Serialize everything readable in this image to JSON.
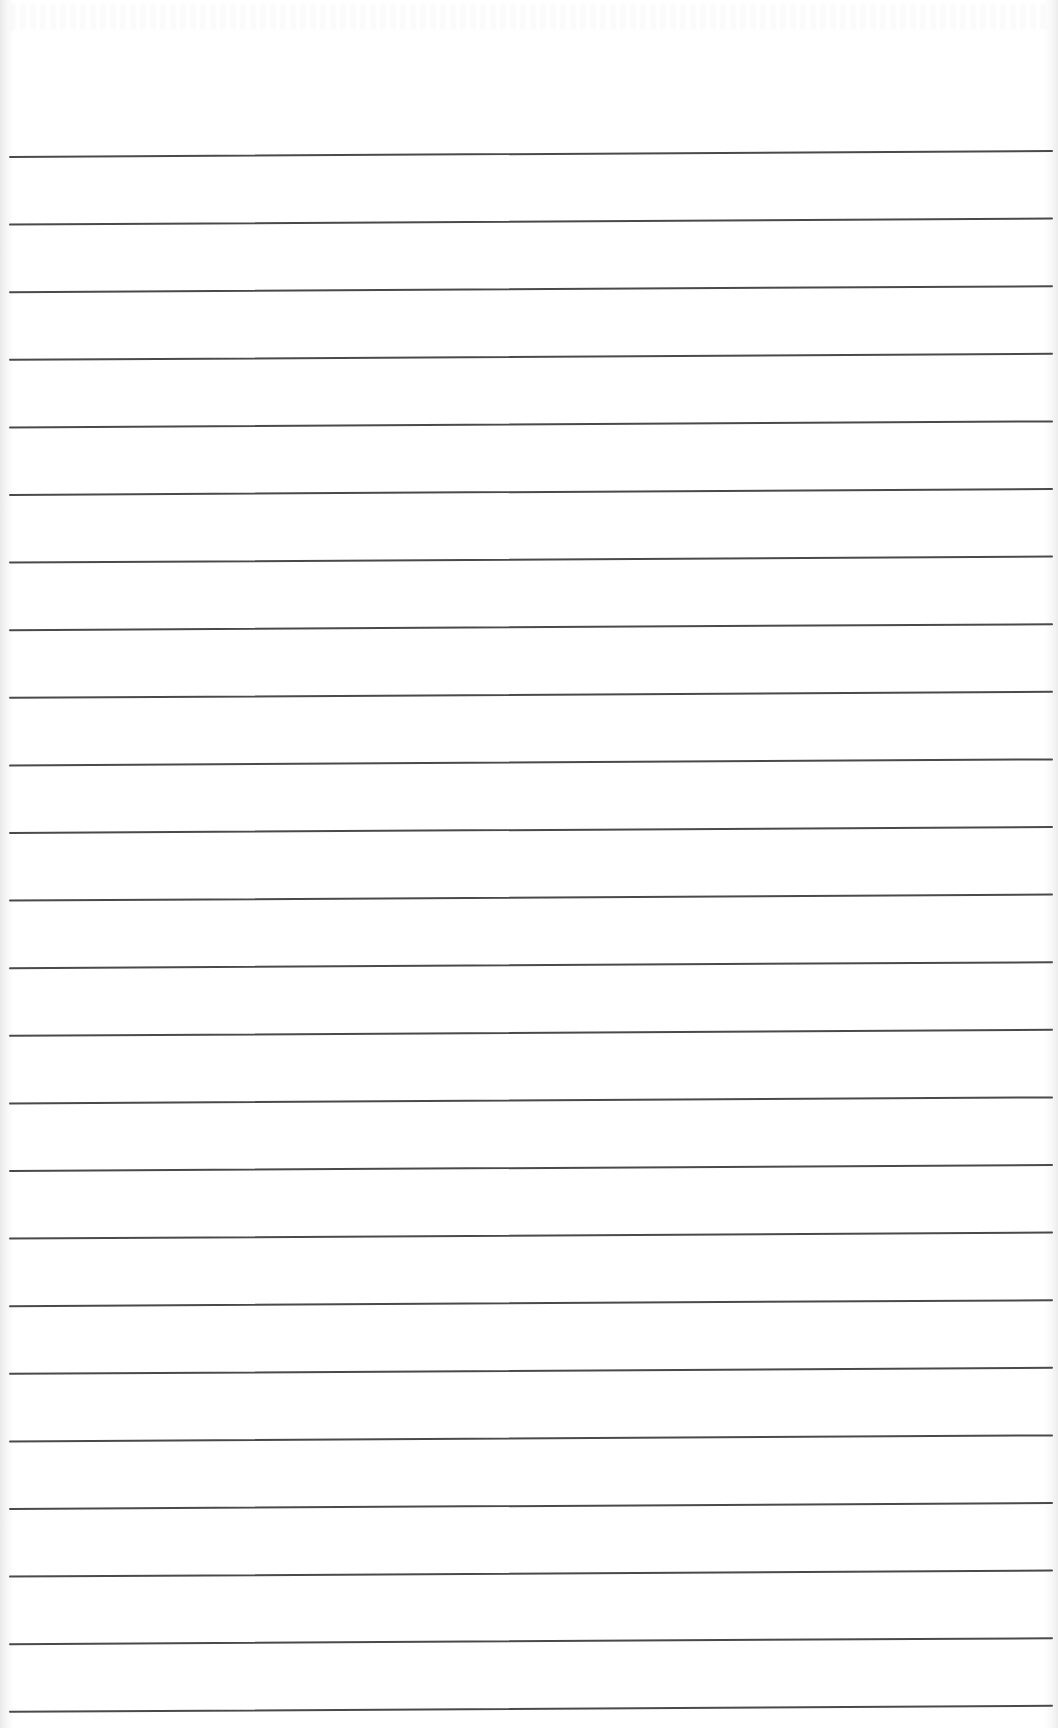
{
  "page": {
    "type": "ruled-paper",
    "width": 1058,
    "height": 1728,
    "background_color": "#ffffff",
    "rule_color": "#4a4a4a",
    "rule_thickness": 2
  },
  "rules": {
    "count": 24,
    "first_y_left": 157,
    "first_y_right": 151,
    "spacing": 67.6,
    "x_start": 10,
    "x_end": 1052
  },
  "text": []
}
